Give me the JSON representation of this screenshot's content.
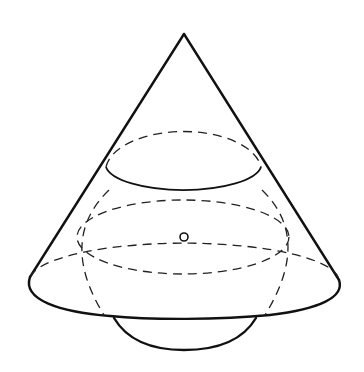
{
  "figure": {
    "elements": {
      "cone": "cone",
      "sphere": "sphere",
      "center_point": "sphere-center",
      "intersection_circle": "cone-sphere-intersection-circle",
      "equator": "sphere-equator",
      "base": "cone-base"
    },
    "colors": {
      "stroke": "#111111",
      "background": "#ffffff"
    }
  }
}
